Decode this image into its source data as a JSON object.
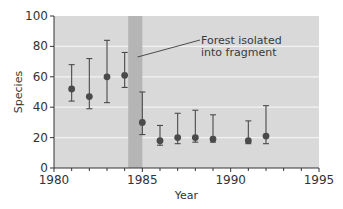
{
  "chart_data": {
    "type": "scatter",
    "subtype": "scatter-with-error-bars",
    "title": "",
    "xlabel": "Year",
    "ylabel": "Species",
    "xlim": [
      1980,
      1995
    ],
    "ylim": [
      0,
      100
    ],
    "xticks": [
      1980,
      1985,
      1990,
      1995
    ],
    "xminor_ticks": [
      1981,
      1982,
      1983,
      1984,
      1986,
      1987,
      1988,
      1989,
      1991,
      1992,
      1993,
      1994
    ],
    "yticks": [
      0,
      20,
      40,
      60,
      80,
      100
    ],
    "grid": "horizontal",
    "legend": null,
    "series": [
      {
        "name": "Species",
        "points": [
          {
            "x": 1981,
            "y": 52,
            "lower": 44,
            "upper": 68
          },
          {
            "x": 1982,
            "y": 47,
            "lower": 39,
            "upper": 72
          },
          {
            "x": 1983,
            "y": 60,
            "lower": 43,
            "upper": 84
          },
          {
            "x": 1984,
            "y": 61,
            "lower": 53,
            "upper": 76
          },
          {
            "x": 1985,
            "y": 30,
            "lower": 22,
            "upper": 50
          },
          {
            "x": 1986,
            "y": 18,
            "lower": 15,
            "upper": 28
          },
          {
            "x": 1987,
            "y": 20,
            "lower": 16,
            "upper": 36
          },
          {
            "x": 1988,
            "y": 20,
            "lower": 17,
            "upper": 38
          },
          {
            "x": 1989,
            "y": 19,
            "lower": 17,
            "upper": 35
          },
          {
            "x": 1991,
            "y": 18,
            "lower": 16,
            "upper": 31
          },
          {
            "x": 1992,
            "y": 21,
            "lower": 16,
            "upper": 41
          }
        ]
      }
    ],
    "shaded_region": {
      "x_start": 1984.2,
      "x_end": 1985.0,
      "label": "Forest isolated into fragment"
    },
    "annotations": [
      {
        "text_lines": [
          "Forest isolated",
          "into fragment"
        ],
        "points_to_x": 1984.9
      }
    ]
  },
  "colors": {
    "plot_background": "#d9d9d9",
    "shaded_band": "#b5b5b5",
    "gridline": "#f2f2f2",
    "marker": "#4a4a4a",
    "axis": "#333333"
  }
}
